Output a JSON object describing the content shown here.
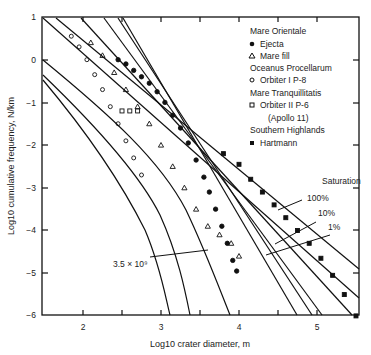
{
  "chart_data": {
    "type": "scatter",
    "title": "",
    "xlabel": "Log10 crater diameter, m",
    "ylabel": "Log10 cumulative frequency, N/km",
    "xlim": [
      1.5,
      5.55
    ],
    "ylim": [
      -6,
      1
    ],
    "x_ticks": [
      "2",
      "3",
      "4",
      "5"
    ],
    "y_ticks": [
      "1",
      "0",
      "−1",
      "−2",
      "−3",
      "−4",
      "−5",
      "−6"
    ],
    "grid": false,
    "legend": {
      "position": "upper right",
      "groups": [
        {
          "heading": "Mare Orientale",
          "entries": [
            {
              "marker": "filled-circle",
              "label": "Ejecta"
            },
            {
              "marker": "open-triangle",
              "label": "Mare fill"
            }
          ]
        },
        {
          "heading": "Oceanus Procellarum",
          "entries": [
            {
              "marker": "open-circle",
              "label": "Orbiter I P-8"
            }
          ]
        },
        {
          "heading": "Mare Tranquillitatis",
          "entries": [
            {
              "marker": "open-square",
              "label": "Orbiter II P-6"
            }
          ],
          "note": "(Apollo 11)"
        },
        {
          "heading": "Southern Highlands",
          "entries": [
            {
              "marker": "filled-square",
              "label": "Hartmann"
            }
          ]
        }
      ]
    },
    "annotations": {
      "saturation_title": "Saturation",
      "saturation_levels": [
        "100%",
        "10%",
        "1%"
      ],
      "age_label": "3.5 × 10⁹"
    },
    "series": [
      {
        "name": "Ejecta",
        "marker": "filled-circle",
        "x": [
          2.45,
          2.55,
          2.65,
          2.75,
          2.85,
          2.95,
          3.05,
          3.15,
          3.25,
          3.35,
          3.45,
          3.55,
          3.62,
          3.7,
          3.78,
          3.85,
          3.92,
          3.97
        ],
        "y": [
          0.0,
          -0.1,
          -0.25,
          -0.4,
          -0.55,
          -0.75,
          -1.0,
          -1.3,
          -1.6,
          -1.95,
          -2.35,
          -2.75,
          -3.1,
          -3.5,
          -3.9,
          -4.3,
          -4.7,
          -4.95
        ]
      },
      {
        "name": "Mare fill",
        "marker": "open-triangle",
        "x": [
          2.1,
          2.25,
          2.4,
          2.55,
          2.7,
          2.85,
          3.0,
          3.15,
          3.3,
          3.45,
          3.6,
          3.75,
          3.9,
          4.0
        ],
        "y": [
          0.4,
          0.1,
          -0.3,
          -0.7,
          -1.1,
          -1.5,
          -2.0,
          -2.5,
          -3.0,
          -3.5,
          -3.9,
          -4.1,
          -4.3,
          -4.6
        ]
      },
      {
        "name": "Orbiter I P-8",
        "marker": "open-circle",
        "x": [
          1.85,
          1.95,
          2.05,
          2.15,
          2.25,
          2.35,
          2.45,
          2.55,
          2.65,
          2.75
        ],
        "y": [
          0.55,
          0.3,
          0.0,
          -0.35,
          -0.7,
          -1.1,
          -1.5,
          -1.9,
          -2.3,
          -2.7
        ]
      },
      {
        "name": "Orbiter II P-6",
        "marker": "open-square",
        "x": [
          2.5,
          2.6,
          2.7
        ],
        "y": [
          -1.2,
          -1.2,
          -1.2
        ]
      },
      {
        "name": "Hartmann",
        "marker": "filled-square",
        "x": [
          3.8,
          4.0,
          4.15,
          4.3,
          4.45,
          4.6,
          4.75,
          4.9,
          5.05,
          5.2,
          5.35,
          5.5
        ],
        "y": [
          -2.2,
          -2.45,
          -2.8,
          -3.1,
          -3.4,
          -3.7,
          -4.0,
          -4.3,
          -4.65,
          -5.05,
          -5.5,
          -6.0
        ]
      }
    ]
  }
}
